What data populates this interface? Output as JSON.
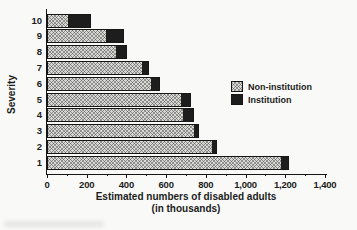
{
  "chart_data": {
    "type": "bar",
    "orientation": "horizontal-stacked",
    "title": "",
    "ylabel": "Severity",
    "xlabel": "Estimated numbers of disabled adults",
    "xlabel_line2": "(in thousands)",
    "categories": [
      "10",
      "9",
      "8",
      "7",
      "6",
      "5",
      "4",
      "3",
      "2",
      "1"
    ],
    "series": [
      {
        "name": "Non-institution",
        "style": "light-gray-crosshatch",
        "values": [
          100,
          290,
          340,
          475,
          520,
          670,
          680,
          735,
          825,
          1175
        ]
      },
      {
        "name": "Institution",
        "style": "solid-black",
        "values": [
          110,
          90,
          55,
          30,
          40,
          45,
          50,
          20,
          20,
          35
        ]
      }
    ],
    "xlim": [
      0,
      1400
    ],
    "x_major_tick_step": 200,
    "x_minor_tick_step": 100,
    "x_tick_labels": [
      "0",
      "200",
      "400",
      "600",
      "800",
      "1,000",
      "1,200",
      "1,400"
    ],
    "grid": false,
    "legend_position": "middle-right",
    "colors": {
      "non_institution": "#d8d8d5",
      "institution": "#1d1d1d",
      "axis": "#161616",
      "text": "#1c1c1c",
      "background": "#f9f9f7"
    }
  }
}
